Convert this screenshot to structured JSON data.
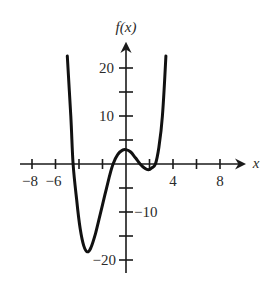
{
  "chart_data": {
    "type": "line",
    "title": "",
    "xlabel": "x",
    "ylabel": "f(x)",
    "xlim": [
      -9.5,
      10
    ],
    "ylim": [
      -22.5,
      25
    ],
    "x_ticks": [
      -8,
      -6,
      -4,
      -2,
      0,
      2,
      4,
      6,
      8
    ],
    "x_tick_labels": [
      {
        "value": -8,
        "label": "−8"
      },
      {
        "value": -6,
        "label": "−6"
      },
      {
        "value": 4,
        "label": "4"
      },
      {
        "value": 8,
        "label": "8"
      }
    ],
    "y_ticks": [
      -20,
      -15,
      -10,
      -5,
      0,
      5,
      10,
      15,
      20
    ],
    "y_tick_labels": [
      {
        "value": 20,
        "label": "20"
      },
      {
        "value": 10,
        "label": "10"
      },
      {
        "value": -10,
        "label": "−10"
      },
      {
        "value": -20,
        "label": "−20"
      }
    ],
    "grid": false,
    "legend": null,
    "series": [
      {
        "name": "f(x)",
        "x": [
          -5.0,
          -4.7,
          -4.5,
          -4.2,
          -3.9,
          -3.6,
          -3.3,
          -3.0,
          -2.6,
          -2.2,
          -1.8,
          -1.4,
          -1.1,
          -0.7,
          -0.3,
          0.0,
          0.4,
          0.8,
          1.2,
          1.6,
          1.9,
          2.2,
          2.5,
          2.8,
          3.1,
          3.4
        ],
        "y": [
          22.5,
          10.0,
          0.0,
          -7.5,
          -13.5,
          -17.0,
          -18.3,
          -17.5,
          -14.5,
          -10.5,
          -6.5,
          -2.5,
          0.0,
          2.0,
          2.9,
          3.0,
          2.5,
          1.3,
          0.0,
          -0.9,
          -1.2,
          -0.8,
          0.0,
          3.5,
          10.0,
          22.5
        ]
      }
    ],
    "key_points": {
      "local_min_left": {
        "x": -3.3,
        "y": -18.3
      },
      "local_max": {
        "x": 0.0,
        "y": 3.0
      },
      "local_min_right": {
        "x": 1.9,
        "y": -1.2
      },
      "x_intercepts": [
        -4.5,
        -1.1,
        1.2,
        2.5
      ]
    }
  }
}
